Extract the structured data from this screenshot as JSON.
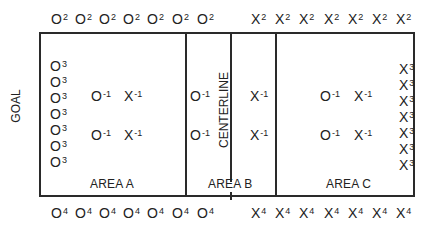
{
  "diagram": {
    "labels": {
      "goal": "GOAL",
      "centerline": "CENTERLINE",
      "area_a": "AREA A",
      "area_b": "AREA B",
      "area_c": "AREA C"
    },
    "top_row": {
      "o": [
        "O",
        "O",
        "O",
        "O",
        "O",
        "O",
        "O"
      ],
      "o_sup": "2",
      "x": [
        "X",
        "X",
        "X",
        "X",
        "X",
        "X",
        "X"
      ],
      "x_sup": "2"
    },
    "bottom_row": {
      "o": [
        "O",
        "O",
        "O",
        "O",
        "O",
        "O",
        "O"
      ],
      "o_sup": "4",
      "x": [
        "X",
        "X",
        "X",
        "X",
        "X",
        "X",
        "X"
      ],
      "x_sup": "4"
    },
    "left_column": {
      "symbol": "O",
      "sup": "3",
      "count": 7
    },
    "right_column": {
      "symbol": "X",
      "sup": "3",
      "count": 7
    },
    "inner": {
      "area_a": [
        {
          "sym": "O",
          "sup": "-1"
        },
        {
          "sym": "X",
          "sup": "-1"
        },
        {
          "sym": "O",
          "sup": "-1"
        },
        {
          "sym": "X",
          "sup": "-1"
        }
      ],
      "area_b": [
        {
          "sym": "O",
          "sup": "-1"
        },
        {
          "sym": "X",
          "sup": "-1"
        },
        {
          "sym": "O",
          "sup": "-1"
        },
        {
          "sym": "X",
          "sup": "-1"
        }
      ],
      "area_c": [
        {
          "sym": "O",
          "sup": "-1"
        },
        {
          "sym": "X",
          "sup": "-1"
        },
        {
          "sym": "O",
          "sup": "-1"
        },
        {
          "sym": "X",
          "sup": "-1"
        }
      ]
    }
  }
}
